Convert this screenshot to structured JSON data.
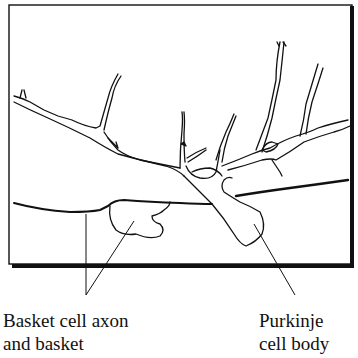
{
  "figure": {
    "colors": {
      "line": "#111111",
      "background": "#ffffff"
    }
  },
  "labels": {
    "basket": {
      "line1": "Basket cell axon",
      "line2": "and basket"
    },
    "purkinje": {
      "line1": "Purkinje",
      "line2": "cell body"
    }
  }
}
